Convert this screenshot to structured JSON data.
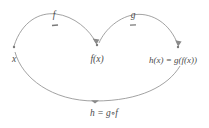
{
  "figure": {
    "type": "function-composition-diagram",
    "background_color": "#ffffff",
    "stroke_color": "#8a8a8a",
    "text_color": "#4a4a4a"
  },
  "nodes": {
    "x": {
      "label": "x",
      "cx": 14,
      "cy": 47,
      "label_x": 14,
      "label_y": 60
    },
    "fx": {
      "label": "f(x)",
      "cx": 97,
      "cy": 45,
      "label_x": 97,
      "label_y": 60
    },
    "hx": {
      "label": "h(x) = g(f(x))",
      "cx": 178,
      "cy": 47,
      "label_x": 173,
      "label_y": 60
    }
  },
  "arrows": {
    "f": {
      "label": "f",
      "label_x": 54,
      "label_y": 16,
      "marker_x": 55,
      "marker_y": 26,
      "from": "x",
      "to": "fx"
    },
    "g": {
      "label": "g",
      "label_x": 133,
      "label_y": 16,
      "marker_x": 133,
      "marker_y": 26,
      "from": "fx",
      "to": "hx"
    },
    "h": {
      "label": "h = g∘f",
      "label_x": 104,
      "label_y": 114,
      "marker_x": 95,
      "marker_y": 101,
      "from": "x",
      "to": "hx"
    }
  }
}
